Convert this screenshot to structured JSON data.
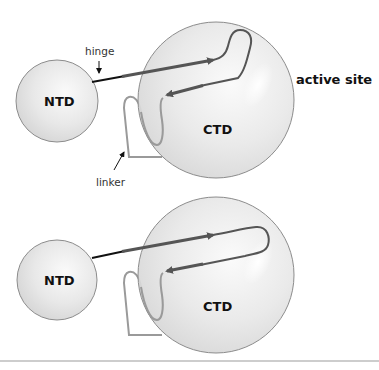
{
  "figure": {
    "panels": [
      {
        "id": "top",
        "ntd_label": "NTD",
        "ctd_label": "CTD",
        "hinge_label": "hinge",
        "linker_label": "linker",
        "active_site_label": "active site"
      },
      {
        "id": "bottom",
        "ntd_label": "NTD",
        "ctd_label": "CTD"
      }
    ],
    "colors": {
      "domain_fill": "#e6e6e6",
      "domain_stroke": "#8c8c8c",
      "helix": "#555555",
      "linker": "#9a9a9a",
      "divider": "#bdbdbd"
    }
  }
}
